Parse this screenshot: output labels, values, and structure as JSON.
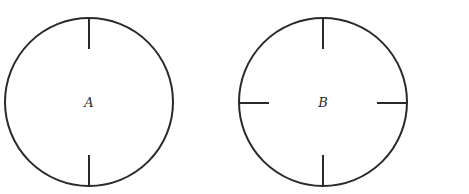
{
  "diagram": {
    "stroke_color": "#2a2a2a",
    "background": "#ffffff",
    "circles": [
      {
        "label": "A",
        "cx": 89,
        "cy": 102,
        "r": 84,
        "ticks": [
          "top",
          "bottom"
        ],
        "tick_length": 31
      },
      {
        "label": "B",
        "cx": 323,
        "cy": 102,
        "r": 84,
        "ticks": [
          "top",
          "bottom",
          "left",
          "right"
        ],
        "tick_length": 31
      }
    ]
  }
}
